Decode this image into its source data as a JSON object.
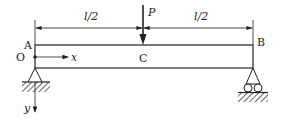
{
  "diagram": {
    "type": "simply-supported-beam",
    "labels": {
      "left_end": "A",
      "right_end": "B",
      "midpoint": "C",
      "origin": "O",
      "x_axis": "x",
      "y_axis": "y",
      "load": "P",
      "left_span": "l/2",
      "right_span": "l/2"
    },
    "supports": {
      "left": "pin-support",
      "right": "roller-support"
    },
    "colors": {
      "line": "#222222",
      "background": "#ffffff"
    }
  }
}
